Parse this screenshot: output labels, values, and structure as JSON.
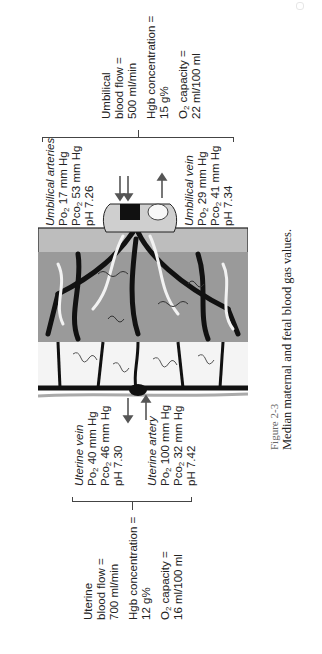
{
  "figure": {
    "number": "Figure 2-3",
    "title": "Median maternal and fetal blood gas values."
  },
  "fetal": {
    "summary": {
      "line1": "Umbilical",
      "line2": "blood flow =",
      "line3": "500 ml/min",
      "hgb_line1": "Hgb concentration =",
      "hgb_line2": "15 g%",
      "o2_label_pre": "O",
      "o2_label_sub": "2",
      "o2_label_post": " capacity =",
      "o2_value": "22 ml/100 ml"
    },
    "umbilical_arteries": {
      "title": "Umbilical arteries",
      "po2_pre": "Po",
      "po2_sub": "2",
      "po2_val": " 17 mm Hg",
      "pco2_pre": "Pco",
      "pco2_sub": "2",
      "pco2_val": " 53 mm Hg",
      "ph": "pH 7.26"
    },
    "umbilical_vein": {
      "title": "Umbilical vein",
      "po2_pre": "Po",
      "po2_sub": "2",
      "po2_val": " 29 mm Hg",
      "pco2_pre": "Pco",
      "pco2_sub": "2",
      "pco2_val": " 41 mm Hg",
      "ph": "pH 7.34"
    }
  },
  "maternal": {
    "summary": {
      "line1": "Uterine",
      "line2": "blood flow =",
      "line3": "700 ml/min",
      "hgb_line1": "Hgb concentration =",
      "hgb_line2": "12 g%",
      "o2_label_pre": "O",
      "o2_label_sub": "2",
      "o2_label_post": " capacity =",
      "o2_value": "16 ml/100 ml"
    },
    "uterine_vein": {
      "title": "Uterine vein",
      "po2_pre": "Po",
      "po2_sub": "2",
      "po2_val": " 40 mm Hg",
      "pco2_pre": "Pco",
      "pco2_sub": "2",
      "pco2_val": " 46 mm Hg",
      "ph": "pH 7.30"
    },
    "uterine_artery": {
      "title": "Uterine artery",
      "po2_pre": "Po",
      "po2_sub": "2",
      "po2_val": " 100 mm Hg",
      "pco2_pre": "Pco",
      "pco2_sub": "2",
      "pco2_val": " 32 mm Hg",
      "ph": "pH 7.42"
    }
  },
  "illustration": {
    "label": "placenta-cross-section",
    "colors": {
      "ink": "#111111",
      "shade": "#8a8a8a",
      "arrow": "#555555"
    }
  }
}
